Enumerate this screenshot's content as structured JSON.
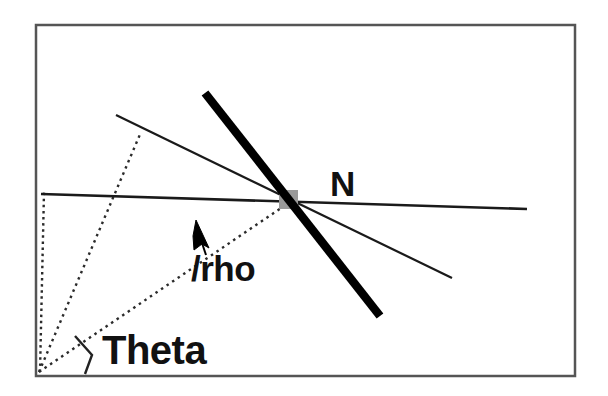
{
  "figure": {
    "background_color": "#ffffff",
    "frame": {
      "name": "outer-border",
      "x": 36,
      "y": 25,
      "width": 539,
      "height": 351,
      "stroke": "#555555",
      "stroke_width": 2.5
    },
    "labels": {
      "theta": "Theta",
      "rho": "/rho",
      "normal_point": "N"
    },
    "colors": {
      "line_stroke": "#1a1a1a",
      "thick_line_stroke": "#000000",
      "dotted_stroke": "#2b2b2b",
      "marker_fill": "#9a9a9a",
      "text": "#111111"
    },
    "geometry": {
      "origin": {
        "name": "origin-point",
        "x": 39,
        "y": 372
      },
      "horizontal_axis_line": {
        "name": "horizontal-reference-line",
        "x1": 41,
        "y1": 194,
        "x2": 527,
        "y2": 209,
        "stroke_width": 2.6
      },
      "thin_diagonal_line": {
        "name": "thin-diagonal-line",
        "x1": 116,
        "y1": 115,
        "x2": 452,
        "y2": 278,
        "stroke_width": 2.2
      },
      "thick_line": {
        "name": "thick-detected-line",
        "x1": 205,
        "y1": 93,
        "x2": 380,
        "y2": 316,
        "stroke_width": 8.5
      },
      "dotted_vertical": {
        "name": "dotted-vertical-axis",
        "x1": 40,
        "y1": 372,
        "x2": 44,
        "y2": 192
      },
      "dotted_perpendicular": {
        "name": "dotted-perpendicular-to-thin-line",
        "x1": 39,
        "y1": 372,
        "x2": 141,
        "y2": 132
      },
      "dotted_rho_ray": {
        "name": "dotted-rho-ray",
        "x1": 39,
        "y1": 372,
        "x2": 293,
        "y2": 200
      },
      "marker_square": {
        "name": "intersection-marker",
        "x": 279,
        "y": 190,
        "width": 19,
        "height": 19
      },
      "rho_arrow": {
        "name": "rho-direction-arrow",
        "tip_x": 196,
        "tip_y": 222,
        "tail_x": 207,
        "tail_y": 250
      },
      "theta_angle_bracket": {
        "name": "theta-angle-bracket",
        "points": "75,336 92,355 85,374"
      }
    }
  }
}
